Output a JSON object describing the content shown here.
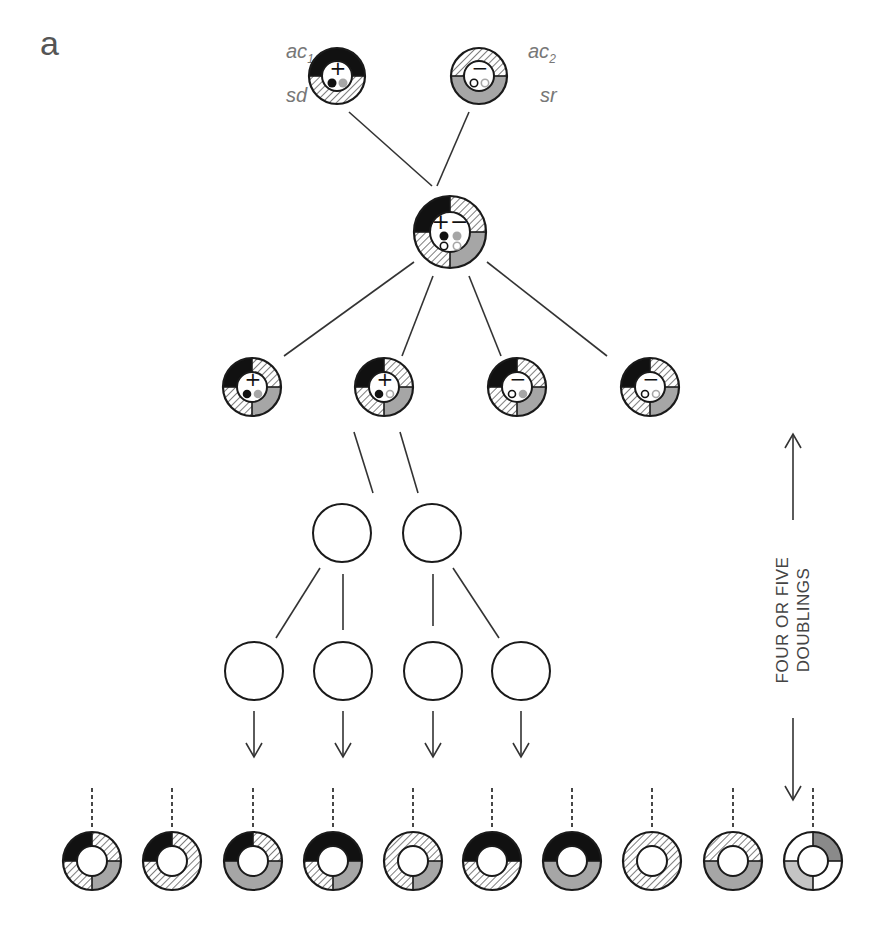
{
  "figure": {
    "panel_label": "a",
    "parents": [
      {
        "id": "parent-1",
        "top_label": "ac",
        "top_sub": "1",
        "bottom_label": "sd",
        "sign": "+",
        "ring": [
          "black",
          "black",
          "hatched",
          "hatched"
        ],
        "dots": [
          {
            "fill": "black"
          },
          {
            "fill": "gray"
          }
        ]
      },
      {
        "id": "parent-2",
        "top_label": "ac",
        "top_sub": "2",
        "bottom_label": "sr",
        "sign": "−",
        "ring": [
          "hatched",
          "hatched",
          "gray",
          "gray"
        ],
        "dots": [
          {
            "fill": "open-black"
          },
          {
            "fill": "open-gray"
          }
        ]
      }
    ],
    "hybrid": {
      "sign": "+−",
      "ring": [
        "black",
        "hatched",
        "gray",
        "hatched"
      ],
      "dots_top": [
        {
          "fill": "black"
        },
        {
          "fill": "gray"
        }
      ],
      "dots_bottom": [
        {
          "fill": "open-black"
        },
        {
          "fill": "open-gray"
        }
      ]
    },
    "segregants": [
      {
        "sign": "+",
        "dots": [
          {
            "fill": "black"
          },
          {
            "fill": "gray"
          }
        ]
      },
      {
        "sign": "+",
        "dots": [
          {
            "fill": "black"
          },
          {
            "fill": "open-gray"
          }
        ]
      },
      {
        "sign": "−",
        "dots": [
          {
            "fill": "open-black"
          },
          {
            "fill": "gray"
          }
        ]
      },
      {
        "sign": "−",
        "dots": [
          {
            "fill": "open-black"
          },
          {
            "fill": "open-gray"
          }
        ]
      }
    ],
    "doublings_label_line1": "FOUR OR FIVE",
    "doublings_label_line2": "DOUBLINGS",
    "bottom_rings": [
      {
        "q": [
          "black",
          "hatched",
          "gray",
          "hatched"
        ]
      },
      {
        "q": [
          "black",
          "hatched",
          "hatched",
          "hatched"
        ]
      },
      {
        "q": [
          "black",
          "hatched",
          "gray",
          "gray"
        ]
      },
      {
        "q": [
          "black",
          "black",
          "gray",
          "hatched"
        ]
      },
      {
        "q": [
          "hatched",
          "hatched",
          "gray",
          "hatched"
        ]
      },
      {
        "q": [
          "black",
          "black",
          "hatched",
          "hatched"
        ]
      },
      {
        "q": [
          "black",
          "black",
          "gray",
          "gray"
        ]
      },
      {
        "q": [
          "hatched",
          "hatched",
          "hatched",
          "hatched"
        ]
      },
      {
        "q": [
          "hatched",
          "hatched",
          "gray",
          "gray"
        ]
      },
      {
        "q": [
          "white",
          "darkgray",
          "white",
          "lightgray"
        ]
      }
    ],
    "colors": {
      "black": "#111111",
      "gray": "#a6a6a6",
      "darkgray": "#8a8a8a",
      "lightgray": "#c4c4c4",
      "hatch_line": "#777777",
      "stroke": "#1a1a1a",
      "line": "#333333"
    }
  }
}
